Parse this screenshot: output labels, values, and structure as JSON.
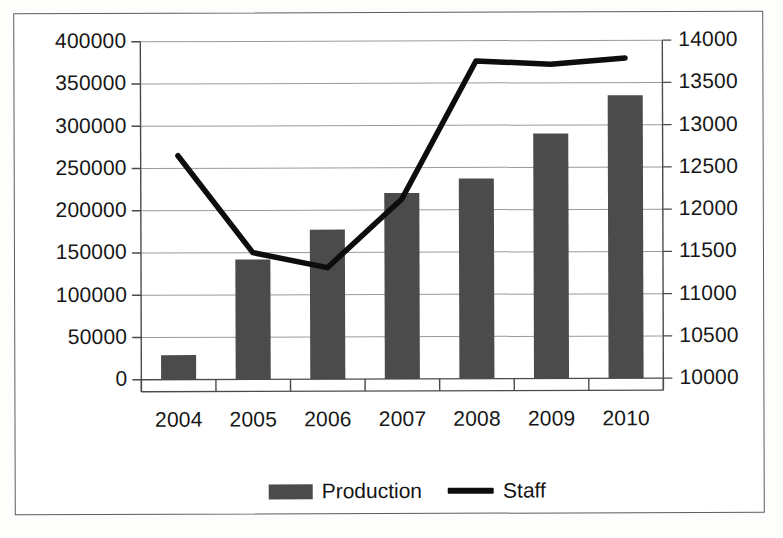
{
  "chart_data": {
    "type": "bar",
    "title": "",
    "subtitle": "",
    "xlabel": "",
    "ylabel": "",
    "categories": [
      "2004",
      "2005",
      "2006",
      "2007",
      "2008",
      "2009",
      "2010"
    ],
    "series": [
      {
        "name": "Production",
        "type": "bar",
        "axis": "left",
        "color": "#4b4b4b",
        "values": [
          29000,
          142000,
          177000,
          220000,
          237000,
          290000,
          335000
        ]
      },
      {
        "name": "Staff",
        "type": "line",
        "axis": "right",
        "color": "#0d0d0d",
        "values": [
          12650,
          11500,
          11320,
          12130,
          13760,
          13720,
          13790
        ]
      }
    ],
    "left_axis": {
      "ticks": [
        "0",
        "50000",
        "100000",
        "150000",
        "200000",
        "250000",
        "300000",
        "350000",
        "400000"
      ],
      "min": 0,
      "max": 400000,
      "step": 50000
    },
    "right_axis": {
      "ticks": [
        "10000",
        "10500",
        "11000",
        "11500",
        "12000",
        "12500",
        "13000",
        "13500",
        "14000"
      ],
      "min": 10000,
      "max": 14000,
      "step": 500
    },
    "grid": true,
    "legend_position": "bottom",
    "legend": [
      {
        "label": "Production",
        "marker": "bar-swatch"
      },
      {
        "label": "Staff",
        "marker": "line-swatch"
      }
    ]
  },
  "colors": {
    "bar": "#4b4b4b",
    "line": "#0d0d0d",
    "grid": "#9a9a9a",
    "axis": "#4a4a4a",
    "frame": "#5d5d5d",
    "text": "#141414",
    "background": "#ffffff"
  }
}
